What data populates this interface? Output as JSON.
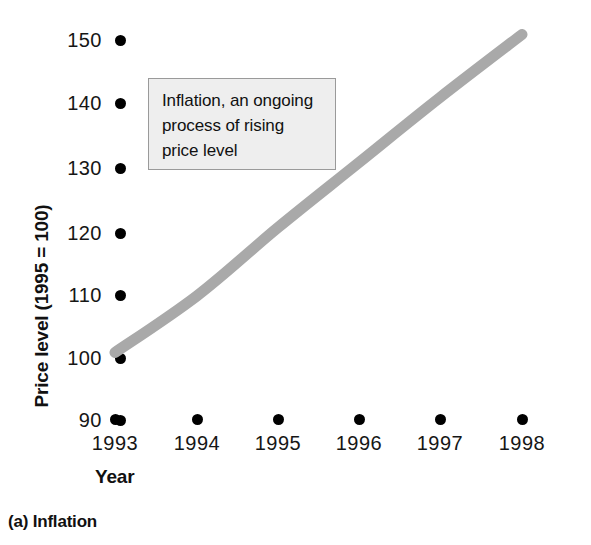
{
  "figure": {
    "caption": "(a) Inflation",
    "annotation": "Inflation, an ongoing process of rising price level",
    "curve_color": "#a9a9a9",
    "marker_color": "#000000",
    "annotation_bg": "#eeeeee",
    "annotation_border": "#9a9a9a"
  },
  "chart_data": {
    "type": "line",
    "title": "(a) Inflation",
    "xlabel": "Year",
    "ylabel": "Price level (1995 = 100)",
    "categories": [
      "1993",
      "1994",
      "1995",
      "1996",
      "1997",
      "1998"
    ],
    "x": [
      1993,
      1994,
      1995,
      1996,
      1997,
      1998
    ],
    "values": [
      100,
      109,
      120,
      130,
      140,
      150
    ],
    "series": [
      {
        "name": "Price level",
        "values": [
          100,
          109,
          120,
          130,
          140,
          150
        ]
      }
    ],
    "ylim": [
      90,
      150
    ],
    "xlim": [
      1993,
      1998
    ],
    "yticks": [
      150,
      140,
      130,
      120,
      110,
      100,
      90
    ],
    "ytick_labels": [
      "150",
      "140",
      "130",
      "120",
      "110",
      "100",
      "90"
    ],
    "xtick_labels": [
      "1993",
      "1994",
      "1995",
      "1996",
      "1997",
      "1998"
    ],
    "grid": false,
    "legend": "none",
    "annotations": [
      {
        "text": "Inflation, an ongoing process of rising price level",
        "lines": [
          "Inflation, an ongoing",
          "process of rising",
          "price level"
        ]
      }
    ]
  },
  "y_ticks": [
    {
      "label": "150",
      "top": 29
    },
    {
      "label": "140",
      "top": 92
    },
    {
      "label": "130",
      "top": 157
    },
    {
      "label": "120",
      "top": 222
    },
    {
      "label": "110",
      "top": 284
    },
    {
      "label": "100",
      "top": 347
    },
    {
      "label": "90",
      "top": 409
    }
  ],
  "x_ticks": [
    {
      "label": "1993",
      "left": 75
    },
    {
      "label": "1994",
      "left": 157
    },
    {
      "label": "1995",
      "left": 238
    },
    {
      "label": "1996",
      "left": 319
    },
    {
      "label": "1997",
      "left": 400
    },
    {
      "label": "1998",
      "left": 482
    }
  ],
  "annotation_lines": [
    "Inflation, an ongoing",
    "process of rising",
    "price level"
  ],
  "axis": {
    "y_title": "Price level (1995 = 100)",
    "x_title": "Year"
  }
}
